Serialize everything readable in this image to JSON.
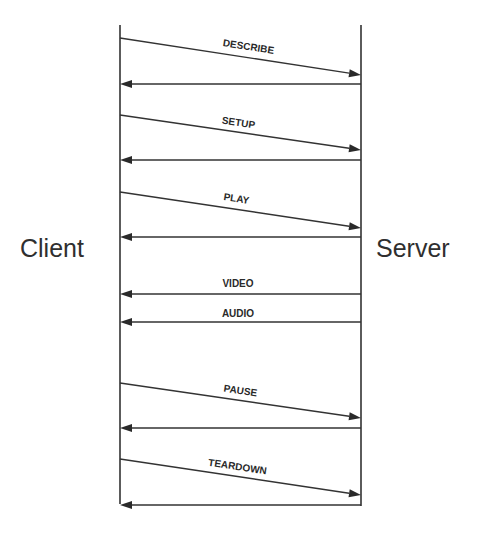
{
  "diagram": {
    "type": "sequence",
    "colors": {
      "line": "#333333",
      "text": "#2a2a2a",
      "background": "#ffffff"
    },
    "participants": [
      {
        "id": "client",
        "label": "Client",
        "x": 120,
        "y_top": 25,
        "y_bottom": 504
      },
      {
        "id": "server",
        "label": "Server",
        "x": 361,
        "y_top": 25,
        "y_bottom": 506
      }
    ],
    "messages": [
      {
        "label": "DESCRIBE",
        "from": "client",
        "to": "server",
        "y_start": 38,
        "y_end": 75,
        "label_x": 248,
        "label_y": 50
      },
      {
        "label": "",
        "from": "server",
        "to": "client",
        "y_start": 84,
        "y_end": 84
      },
      {
        "label": "SETUP",
        "from": "client",
        "to": "server",
        "y_start": 115,
        "y_end": 150,
        "label_x": 238,
        "label_y": 126
      },
      {
        "label": "",
        "from": "server",
        "to": "client",
        "y_start": 160,
        "y_end": 160
      },
      {
        "label": "PLAY",
        "from": "client",
        "to": "server",
        "y_start": 192,
        "y_end": 228,
        "label_x": 236,
        "label_y": 202
      },
      {
        "label": "",
        "from": "server",
        "to": "client",
        "y_start": 237,
        "y_end": 237
      },
      {
        "label": "VIDEO",
        "from": "server",
        "to": "client",
        "y_start": 294,
        "y_end": 294,
        "label_x": 238,
        "label_y": 287
      },
      {
        "label": "AUDIO",
        "from": "server",
        "to": "client",
        "y_start": 322,
        "y_end": 322,
        "label_x": 238,
        "label_y": 317
      },
      {
        "label": "PAUSE",
        "from": "client",
        "to": "server",
        "y_start": 383,
        "y_end": 418,
        "label_x": 240,
        "label_y": 394
      },
      {
        "label": "",
        "from": "server",
        "to": "client",
        "y_start": 428,
        "y_end": 428
      },
      {
        "label": "TEARDOWN",
        "from": "client",
        "to": "server",
        "y_start": 459,
        "y_end": 495,
        "label_x": 237,
        "label_y": 470
      },
      {
        "label": "",
        "from": "server",
        "to": "client",
        "y_start": 505,
        "y_end": 505
      }
    ]
  }
}
